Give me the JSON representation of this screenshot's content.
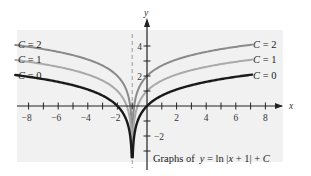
{
  "chart_data": {
    "type": "line",
    "caption_prefix": "Graphs of",
    "caption_formula": "y = ln |x + 1| + C",
    "xlabel": "x",
    "ylabel": "y",
    "xlim": [
      -9,
      9
    ],
    "ylim": [
      -3,
      5
    ],
    "x_ticks": [
      -8,
      -7,
      -6,
      -5,
      -4,
      -3,
      -2,
      -1,
      1,
      2,
      3,
      4,
      5,
      6,
      7,
      8
    ],
    "x_tick_labels": [
      "-8",
      "-6",
      "-4",
      "-2",
      "2",
      "4",
      "6",
      "8"
    ],
    "x_tick_label_values": [
      -8,
      -6,
      -4,
      -2,
      2,
      4,
      6,
      8
    ],
    "y_ticks": [
      -3,
      -2,
      -1,
      1,
      2,
      3,
      4
    ],
    "y_tick_labels": [
      "4",
      "2",
      "-2"
    ],
    "y_tick_label_values": [
      4,
      2,
      -2
    ],
    "asymptote": {
      "x": -1,
      "style": "dashed"
    },
    "grid": false,
    "series": [
      {
        "name": "C = 2",
        "C": 2,
        "color": "#8a8a8a",
        "width": 2
      },
      {
        "name": "C = 1",
        "C": 1,
        "color": "#a9a9a9",
        "width": 2
      },
      {
        "name": "C = 0",
        "C": 0,
        "color": "#1a1a1a",
        "width": 2.4
      }
    ],
    "legend_position": "inline-at-curve-ends",
    "background": "#f1f1f1"
  },
  "labels": {
    "left": [
      "C = 2",
      "C = 1",
      "C = 0"
    ],
    "right": [
      "C = 2",
      "C = 1",
      "C = 0"
    ]
  }
}
